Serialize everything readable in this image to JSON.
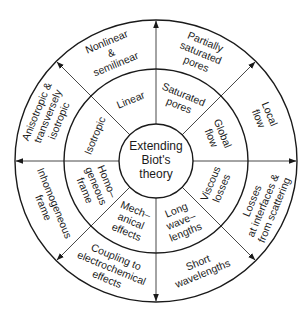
{
  "diagram": {
    "center": {
      "label_lines": [
        "Extending",
        "Biot's",
        "theory"
      ]
    },
    "geometry": {
      "cx": 156,
      "cy": 161,
      "r_inner": 37,
      "r_middle": 92,
      "r_outer": 141
    },
    "colors": {
      "stroke": "#1a1a1a",
      "text": "#1a1a1a",
      "background": "#ffffff"
    },
    "sectors": [
      {
        "angle": -22.5,
        "inner": [
          "Linear"
        ],
        "outer": [
          "Nonlinear",
          "&",
          "semilinear"
        ]
      },
      {
        "angle": 22.5,
        "inner": [
          "Saturated",
          "pores"
        ],
        "outer": [
          "Partially",
          "saturated",
          "pores"
        ]
      },
      {
        "angle": 67.5,
        "inner": [
          "Global",
          "flow"
        ],
        "outer": [
          "Local",
          "flow"
        ]
      },
      {
        "angle": 112.5,
        "inner": [
          "Viscous",
          "losses"
        ],
        "outer": [
          "Losses",
          "at interfaces &",
          "from scattering"
        ]
      },
      {
        "angle": 157.5,
        "inner": [
          "Long",
          "wave–",
          "lengths"
        ],
        "outer": [
          "Short",
          "wavelengths"
        ]
      },
      {
        "angle": 202.5,
        "inner": [
          "Mech–",
          "anical",
          "effects"
        ],
        "outer": [
          "Coupling to",
          "electrochemical",
          "effects"
        ]
      },
      {
        "angle": 247.5,
        "inner": [
          "Homo–",
          "geneous",
          "frame"
        ],
        "outer": [
          "Inhomogeneous",
          "frame"
        ]
      },
      {
        "angle": 292.5,
        "inner": [
          "Isotropic"
        ],
        "outer": [
          "Anisotropic &",
          "transversely",
          "isotropic"
        ]
      }
    ],
    "spoke_angles": [
      0,
      45,
      90,
      135,
      180,
      225,
      270,
      315
    ],
    "arrow_direction": "outward"
  }
}
